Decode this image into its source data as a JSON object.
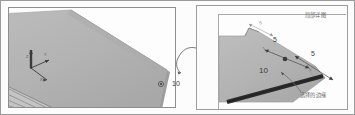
{
  "figure": {
    "kind": "cad-technical-illustration",
    "width": 355,
    "height": 115,
    "background_color": "#fdfdfd",
    "border_color": "#9a9a9a"
  },
  "colors": {
    "plate_face": "#b4b4b4",
    "plate_face_light": "#c2c2c2",
    "plate_side": "#8f8f8f",
    "selected_edge": "#2b2b2b",
    "leader_line": "#6b6b6b",
    "dimension_line": "#4a4a4a",
    "frame": "#9a9a9a",
    "text": "#4a4a4a"
  },
  "overview_panel": {
    "name": "overview-view",
    "geometry_label": "large-plate-isometric",
    "axis_triad": {
      "name": "coordinate-triad",
      "axes": [
        {
          "id": "z",
          "label": "Z"
        },
        {
          "id": "y",
          "label": "Y"
        },
        {
          "id": "x",
          "label": "X"
        }
      ]
    },
    "callout_value": "10",
    "hatched_region": {
      "name": "hatched-section",
      "stripe_count": 4
    }
  },
  "detail_panel": {
    "name": "detail-view",
    "title": "局部详图",
    "selected_edge_label": "选择的边缘",
    "dimensions": [
      {
        "id": "chamfer-upper",
        "value": "5"
      },
      {
        "id": "chamfer-lower",
        "value": "5"
      },
      {
        "id": "edge-length",
        "value": "10"
      },
      {
        "id": "notch-dim",
        "value": "5"
      }
    ]
  },
  "leader": {
    "name": "detail-leader-line",
    "description": "curved leader from detail view to overview corner"
  }
}
